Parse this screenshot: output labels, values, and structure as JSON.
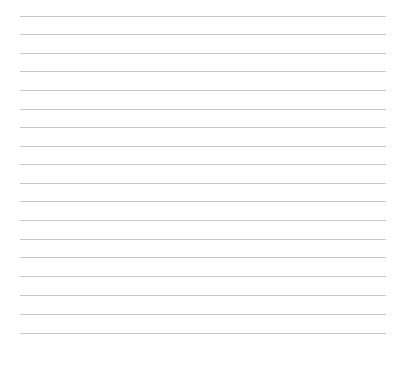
{
  "page": {
    "type": "lined-sheet",
    "background_color": "#ffffff",
    "line_color": "#c9c9c9",
    "line_count": 18,
    "line_left": 20,
    "line_width": 366,
    "line_y": [
      16,
      34,
      53,
      71,
      90,
      109,
      127,
      146,
      164,
      183,
      201,
      220,
      239,
      257,
      276,
      295,
      314,
      333
    ]
  }
}
